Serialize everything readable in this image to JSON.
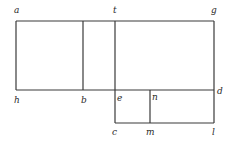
{
  "diagram": {
    "type": "geometric-rectangles",
    "stroke_color": "#3a3a3a",
    "background": "#ffffff",
    "points": {
      "a": {
        "x": 16,
        "y": 21
      },
      "t": {
        "x": 115,
        "y": 21
      },
      "g": {
        "x": 214,
        "y": 21
      },
      "h": {
        "x": 16,
        "y": 90
      },
      "b": {
        "x": 83,
        "y": 90
      },
      "e": {
        "x": 115,
        "y": 90
      },
      "n": {
        "x": 150,
        "y": 90
      },
      "d": {
        "x": 214,
        "y": 90
      },
      "c": {
        "x": 115,
        "y": 123
      },
      "m": {
        "x": 150,
        "y": 123
      },
      "l": {
        "x": 214,
        "y": 123
      }
    },
    "segments": [
      [
        "a",
        "g"
      ],
      [
        "h",
        "d"
      ],
      [
        "c",
        "l"
      ],
      [
        "a",
        "h"
      ],
      [
        "b",
        "b_top"
      ],
      [
        "t",
        "c"
      ],
      [
        "n",
        "m"
      ],
      [
        "g",
        "l"
      ]
    ],
    "labels": [
      {
        "id": "a",
        "text": "a"
      },
      {
        "id": "t",
        "text": "t"
      },
      {
        "id": "g",
        "text": "g"
      },
      {
        "id": "h",
        "text": "h"
      },
      {
        "id": "b",
        "text": "b"
      },
      {
        "id": "e",
        "text": "e"
      },
      {
        "id": "n",
        "text": "n"
      },
      {
        "id": "d",
        "text": "d"
      },
      {
        "id": "c",
        "text": "c"
      },
      {
        "id": "m",
        "text": "m"
      },
      {
        "id": "l",
        "text": "l"
      }
    ]
  }
}
